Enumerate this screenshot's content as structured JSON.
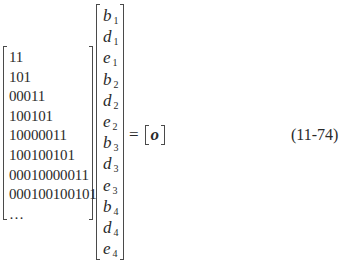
{
  "equation": {
    "matrix_rows": [
      "11",
      "101",
      "00011",
      "100101",
      "10000011",
      "100100101",
      "00010000011",
      "000100100101",
      "…"
    ],
    "vector_entries": [
      {
        "symbol": "b",
        "subscript": "1"
      },
      {
        "symbol": "d",
        "subscript": "1"
      },
      {
        "symbol": "e",
        "subscript": "1"
      },
      {
        "symbol": "b",
        "subscript": "2"
      },
      {
        "symbol": "d",
        "subscript": "2"
      },
      {
        "symbol": "e",
        "subscript": "2"
      },
      {
        "symbol": "b",
        "subscript": "3"
      },
      {
        "symbol": "d",
        "subscript": "3"
      },
      {
        "symbol": "e",
        "subscript": "3"
      },
      {
        "symbol": "b",
        "subscript": "4"
      },
      {
        "symbol": "d",
        "subscript": "4"
      },
      {
        "symbol": "e",
        "subscript": "4"
      }
    ],
    "equals_sign": "=",
    "rhs_symbol": "o",
    "equation_number": "(11-74)"
  }
}
